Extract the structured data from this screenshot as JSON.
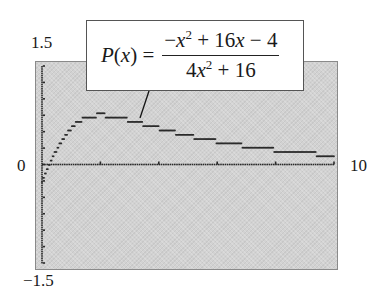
{
  "window": {
    "ymax_label": "1.5",
    "ymin_label": "-1.5",
    "xmin_label": "0",
    "xmax_label": "10",
    "xmin": 0,
    "xmax": 10,
    "ymin": -1.5,
    "ymax": 1.5
  },
  "formula": {
    "lhs": "P(x) =",
    "numerator": "−x² + 16x − 4",
    "denominator": "4x² + 16",
    "text": "P(x) = (-x^2 + 16x - 4) / (4x^2 + 16)"
  },
  "colors": {
    "screen_bg": "#d2d2d2",
    "plot_pixels": "#2a2a2a",
    "axes": "#333333"
  },
  "chart_data": {
    "type": "line",
    "xlabel": "",
    "ylabel": "",
    "xlim": [
      0,
      10
    ],
    "ylim": [
      -1.5,
      1.5
    ],
    "grid": false,
    "x_ticks": [
      0,
      2,
      4,
      6,
      8,
      10
    ],
    "y_tick_labels": [
      "-1.5",
      "1.5"
    ],
    "x_tick_labels": [
      "0",
      "10"
    ],
    "series": [
      {
        "name": "P(x)",
        "x": [
          0,
          0.25,
          0.5,
          0.75,
          1,
          1.25,
          1.5,
          1.75,
          2,
          2.5,
          3,
          3.5,
          4,
          4.5,
          5,
          5.5,
          6,
          6.5,
          7,
          7.5,
          8,
          8.5,
          9,
          9.5,
          10
        ],
        "values": [
          -0.25,
          0.0,
          0.23,
          0.42,
          0.55,
          0.64,
          0.69,
          0.72,
          0.72,
          0.71,
          0.67,
          0.62,
          0.57,
          0.53,
          0.49,
          0.45,
          0.41,
          0.38,
          0.36,
          0.33,
          0.31,
          0.29,
          0.27,
          0.26,
          0.24
        ]
      }
    ],
    "annotations": [
      {
        "text": "P(x) = (-x^2 + 16x - 4)/(4x^2 + 16)",
        "points_to_x": 3.3
      }
    ]
  }
}
